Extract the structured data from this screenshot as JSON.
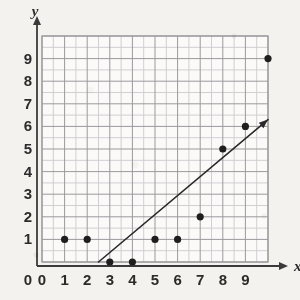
{
  "chart_data": {
    "type": "scatter",
    "title": "",
    "subtitle": "",
    "xlabel": "x",
    "ylabel": "y",
    "xlim": [
      0,
      10
    ],
    "ylim": [
      0,
      10
    ],
    "grid": true,
    "minor_grid": true,
    "minor_grid_step": 0.5,
    "legend": false,
    "x_ticks": [
      0,
      1,
      2,
      3,
      4,
      5,
      6,
      7,
      8,
      9
    ],
    "y_ticks": [
      0,
      1,
      2,
      3,
      4,
      5,
      6,
      7,
      8,
      9
    ],
    "x_tick_labels": [
      "0",
      "1",
      "2",
      "3",
      "4",
      "5",
      "6",
      "7",
      "8",
      "9"
    ],
    "y_tick_labels": [
      "0",
      "1",
      "2",
      "3",
      "4",
      "5",
      "6",
      "7",
      "8",
      "9"
    ],
    "points": [
      {
        "x": 1,
        "y": 1
      },
      {
        "x": 2,
        "y": 1
      },
      {
        "x": 3,
        "y": 0
      },
      {
        "x": 4,
        "y": 0
      },
      {
        "x": 5,
        "y": 1
      },
      {
        "x": 6,
        "y": 1
      },
      {
        "x": 7,
        "y": 2
      },
      {
        "x": 8,
        "y": 5
      },
      {
        "x": 9,
        "y": 6
      },
      {
        "x": 10,
        "y": 9
      }
    ],
    "trend_line": {
      "x_start": 2.5,
      "y_start": 0,
      "x_end": 10,
      "y_end": 6.3,
      "arrow_end": true
    },
    "colors": {
      "background": "#f4f2ee",
      "plot_area": "#fbfaf8",
      "major_grid": "#9a9a9e",
      "minor_grid": "#cfcfd4",
      "axis": "#3a3a3a",
      "point": "#1e1e1e",
      "trend_line": "#2a2a2a",
      "text": "#2b2b2b"
    }
  }
}
